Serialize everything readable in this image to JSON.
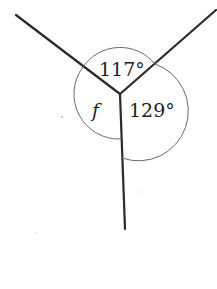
{
  "diagram": {
    "angles": [
      {
        "id": "top",
        "label": "117°",
        "degrees": 117
      },
      {
        "id": "right",
        "label": "129°",
        "degrees": 129
      },
      {
        "id": "left",
        "label": "f",
        "degrees": null
      }
    ],
    "colors": {
      "line": "#2a2a2a",
      "arc": "#6a6a6a",
      "text": "#1e1e1e",
      "background": "#ffffff"
    }
  }
}
